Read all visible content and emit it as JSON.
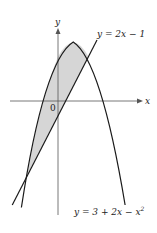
{
  "figure": {
    "axes": {
      "x_label": "x",
      "y_label": "y",
      "origin_label": "0"
    },
    "curves": [
      {
        "name": "line",
        "label": "y = 2x − 1",
        "equation": "y = 2x - 1"
      },
      {
        "name": "parabola",
        "label_prefix": "y = 3 + 2x − x",
        "label_exp": "2",
        "equation": "y = 3 + 2x - x^2"
      }
    ],
    "shaded_region": "area between y = 3 + 2x - x^2 and y = 2x - 1, for -2 <= x <= 2",
    "colors": {
      "curve": "#1a1a1a",
      "axis": "#555555",
      "shade": "#d6d6d6"
    }
  }
}
